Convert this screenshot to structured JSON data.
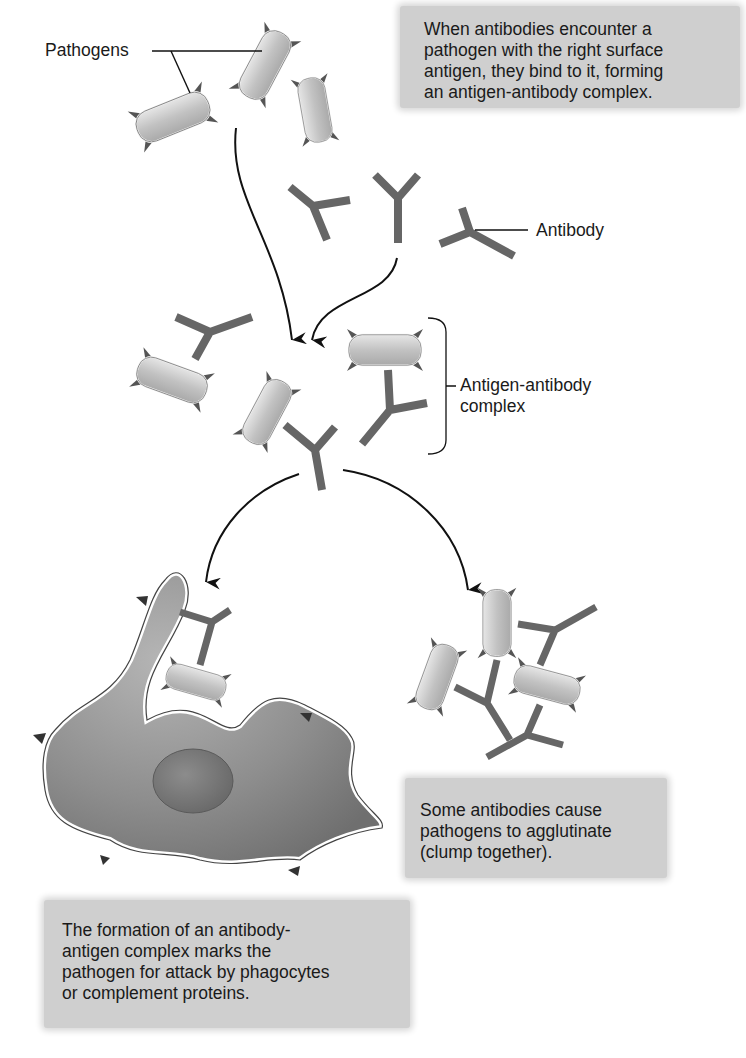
{
  "labels": {
    "pathogens": "Pathogens",
    "antibody": "Antibody",
    "complex_line1": "Antigen-antibody",
    "complex_line2": "complex"
  },
  "callouts": {
    "top": {
      "lines": [
        "When antibodies encounter a",
        "pathogen with the right surface",
        "antigen, they bind to it, forming",
        "an antigen-antibody complex."
      ]
    },
    "agglutinate": {
      "lines": [
        "Some antibodies cause",
        "pathogens to agglutinate",
        "(clump together)."
      ]
    },
    "phagocyte": {
      "lines": [
        "The formation of an antibody-",
        "antigen complex marks the",
        "pathogen for attack by phagocytes",
        "or complement proteins."
      ]
    }
  },
  "colors": {
    "callout_bg": "#cfcfcf",
    "pathogen_fill": "#c4c4c4",
    "antibody": "#6e6e6e",
    "cell_fill": "#8f8f8f",
    "nucleus": "#7a7a7a",
    "arrow": "#111111"
  },
  "icons": [
    "pathogen-icon",
    "antibody-icon",
    "phagocyte-icon",
    "arrow-icon"
  ]
}
